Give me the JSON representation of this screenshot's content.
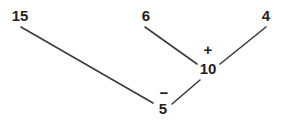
{
  "diagram": {
    "type": "number-decomposition-tree",
    "background_color": "#ffffff",
    "stroke_color": "#3b3b3b",
    "text_color": "#231f20",
    "nodes": [
      {
        "id": "n15",
        "label": "15",
        "x": 20,
        "y": 21,
        "font_size": 15,
        "anchor": "middle",
        "role": "minuend"
      },
      {
        "id": "n6",
        "label": "6",
        "x": 146,
        "y": 21,
        "font_size": 15,
        "anchor": "middle",
        "role": "addend"
      },
      {
        "id": "n4",
        "label": "4",
        "x": 266,
        "y": 21,
        "font_size": 15,
        "anchor": "middle",
        "role": "addend"
      },
      {
        "id": "n10",
        "label": "10",
        "x": 208,
        "y": 74,
        "font_size": 15,
        "anchor": "middle",
        "role": "sum"
      },
      {
        "id": "n5",
        "label": "5",
        "x": 163,
        "y": 114,
        "font_size": 15,
        "anchor": "middle",
        "role": "subtrahend"
      }
    ],
    "operators": [
      {
        "id": "op-plus",
        "label": "+",
        "x": 208,
        "y": 55,
        "font_size": 15,
        "anchor": "middle",
        "meaning": "addition"
      },
      {
        "id": "op-minus",
        "label": "−",
        "x": 164,
        "y": 98,
        "font_size": 15,
        "anchor": "middle",
        "meaning": "subtraction"
      }
    ],
    "edges": [
      {
        "id": "edge-15-5",
        "from": "n15",
        "to": "n5",
        "x1": 21,
        "y1": 27,
        "x2": 153,
        "y2": 103
      },
      {
        "id": "edge-6-10",
        "from": "n6",
        "to": "n10",
        "x1": 145,
        "y1": 27,
        "x2": 197,
        "y2": 64
      },
      {
        "id": "edge-4-10",
        "from": "n4",
        "to": "n10",
        "x1": 266,
        "y1": 27,
        "x2": 220,
        "y2": 64
      },
      {
        "id": "edge-5-10",
        "from": "n5",
        "to": "n10",
        "x1": 172,
        "y1": 104,
        "x2": 200,
        "y2": 80
      }
    ]
  }
}
